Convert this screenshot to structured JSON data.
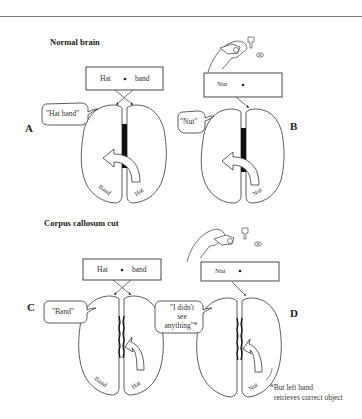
{
  "figure": {
    "normal_heading": "Normal brain",
    "cut_heading": "Corpus callosum cut",
    "panels": {
      "A": {
        "label": "A",
        "screen_left_word": "Hat",
        "screen_right_word": "band",
        "speech": "\"Hat band\"",
        "left_hemisphere_word": "Band",
        "right_hemisphere_word": "Hat"
      },
      "B": {
        "label": "B",
        "screen_word": "Nut",
        "speech": "\"Nut\"",
        "right_hemisphere_word": "Nut"
      },
      "C": {
        "label": "C",
        "screen_left_word": "Hat",
        "screen_right_word": "band",
        "speech": "\"Band\"",
        "left_hemisphere_word": "Band",
        "right_hemisphere_word": "Hat"
      },
      "D": {
        "label": "D",
        "screen_word": "Nut",
        "speech_line1": "\"I didn't",
        "speech_line2": "see",
        "speech_line3": "anything\"*",
        "right_hemisphere_word": "Nut",
        "footnote_line1": "*But left hand",
        "footnote_line2": "retrieves correct object"
      }
    },
    "colors": {
      "ink": "#222222",
      "callosum": "#111111",
      "rule": "#777777"
    }
  }
}
